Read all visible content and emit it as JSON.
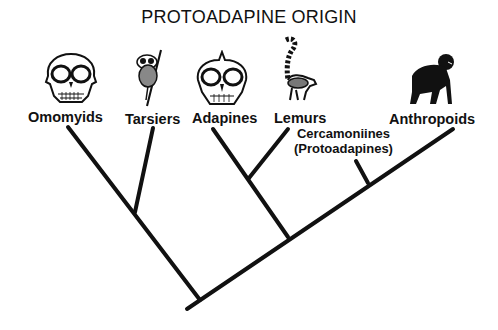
{
  "title": "PROTOADAPINE ORIGIN",
  "taxa": [
    {
      "label": "Omomyids",
      "icon": "primate-skull-icon"
    },
    {
      "label": "Tarsiers",
      "icon": "tarsier-icon"
    },
    {
      "label": "Adapines",
      "icon": "adapine-skull-icon"
    },
    {
      "label": "Lemurs",
      "icon": "ring-tailed-lemur-icon"
    },
    {
      "label": "Anthropoids",
      "icon": "chimpanzee-icon"
    }
  ],
  "cercamoniines": {
    "line1": "Cercamoniines",
    "line2": "(Protoadapines)"
  },
  "tree": {
    "root": [
      187,
      309
    ],
    "branches": [
      {
        "name": "omomyids",
        "from": [
          200,
          300
        ],
        "to": [
          68,
          127
        ]
      },
      {
        "name": "tarsiers",
        "from": [
          135,
          212
        ],
        "to": [
          153,
          128
        ]
      },
      {
        "name": "adapines",
        "from": [
          288,
          237
        ],
        "to": [
          213,
          129
        ]
      },
      {
        "name": "lemurs",
        "from": [
          249,
          178
        ],
        "to": [
          288,
          129
        ]
      },
      {
        "name": "anthropoids",
        "from": [
          187,
          309
        ],
        "to": [
          453,
          129
        ]
      },
      {
        "name": "cercamoniines",
        "from": [
          368,
          183
        ],
        "to": [
          356,
          161
        ]
      }
    ],
    "stroke_color": "#111111"
  }
}
